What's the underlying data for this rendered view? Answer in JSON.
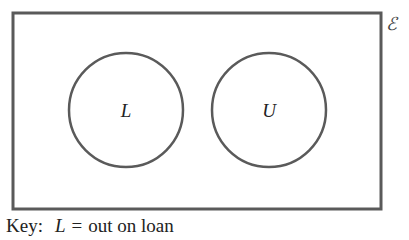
{
  "diagram": {
    "type": "venn",
    "universal_symbol": "ℰ",
    "sets": [
      {
        "label": "L"
      },
      {
        "label": "U"
      }
    ],
    "stroke_color": "#5a5a5a"
  },
  "key": {
    "prefix": "Key:",
    "variable": "L",
    "equals": "=",
    "meaning": "out on loan"
  }
}
